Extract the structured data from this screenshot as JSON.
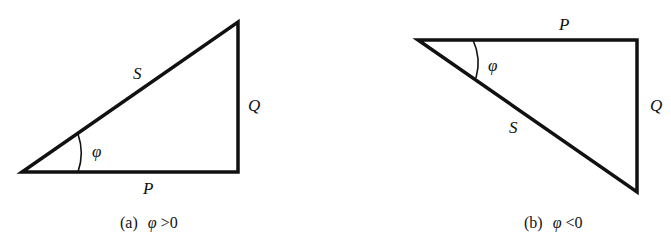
{
  "diagrams": [
    {
      "id": "a",
      "caption_prefix": "(a)",
      "caption_symbol": "φ",
      "caption_relation": ">0",
      "labels": {
        "hypotenuse": "S",
        "vertical": "Q",
        "horizontal": "P",
        "angle": "φ"
      }
    },
    {
      "id": "b",
      "caption_prefix": "(b)",
      "caption_symbol": "φ",
      "caption_relation": "<0",
      "labels": {
        "hypotenuse": "S",
        "vertical": "Q",
        "horizontal": "P",
        "angle": "φ"
      }
    }
  ],
  "colors": {
    "stroke": "#111111",
    "background": "#ffffff"
  }
}
